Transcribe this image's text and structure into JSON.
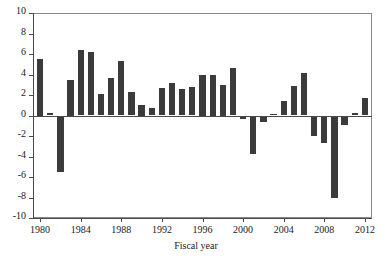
{
  "chart_data": {
    "type": "bar",
    "title": "",
    "xlabel": "Fiscal year",
    "ylabel": "",
    "xlim": [
      1979.3,
      2012.7
    ],
    "ylim": [
      -10,
      10
    ],
    "grid": false,
    "legend": null,
    "bar_color": "#3b3b3b",
    "axis_color": "#4a4a4a",
    "xticks": [
      1980,
      1984,
      1988,
      1992,
      1996,
      2000,
      2004,
      2008,
      2012
    ],
    "xtick_labels": [
      "1980",
      "1984",
      "1988",
      "1992",
      "1996",
      "2000",
      "2004",
      "2008",
      "2012"
    ],
    "yticks": [
      -10,
      -8,
      -6,
      -4,
      -2,
      0,
      2,
      4,
      6,
      8,
      10
    ],
    "ytick_labels": [
      "-10",
      "-8",
      "-6",
      "-4",
      "-2",
      "0",
      "2",
      "4",
      "6",
      "8",
      "10"
    ],
    "categories": [
      1980,
      1981,
      1982,
      1983,
      1984,
      1985,
      1986,
      1987,
      1988,
      1989,
      1990,
      1991,
      1992,
      1993,
      1994,
      1995,
      1996,
      1997,
      1998,
      1999,
      2000,
      2001,
      2002,
      2003,
      2004,
      2005,
      2006,
      2007,
      2008,
      2009,
      2010,
      2011,
      2012
    ],
    "values": [
      5.5,
      0.2,
      -5.5,
      3.5,
      6.4,
      6.2,
      2.1,
      3.7,
      5.3,
      2.3,
      1.0,
      0.7,
      2.7,
      3.2,
      2.6,
      2.8,
      4.0,
      4.0,
      3.0,
      4.6,
      -0.3,
      -3.8,
      -0.6,
      0.1,
      1.4,
      2.9,
      4.1,
      -2.0,
      -2.7,
      -8.0,
      -0.9,
      0.2,
      1.7
    ]
  }
}
